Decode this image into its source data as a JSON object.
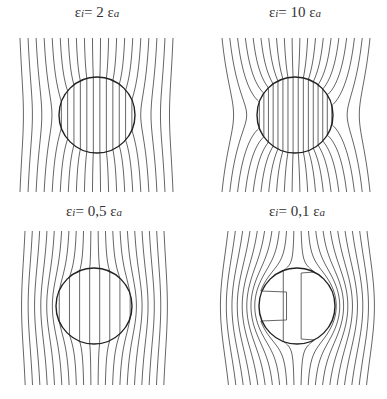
{
  "figure": {
    "panels": [
      {
        "id": "top-left",
        "title_prefix": "ε",
        "title_sub": "i",
        "title_mid": "= 2 ε",
        "title_sub2": "a",
        "ratio": 2,
        "title_pos": [
          97,
          14
        ],
        "circle": {
          "cx": 97,
          "cy": 115,
          "r": 38
        },
        "box": {
          "x0": 20,
          "x1": 173,
          "y0": 38,
          "y1": 192
        },
        "line_count": 20
      },
      {
        "id": "top-right",
        "title_prefix": "ε",
        "title_sub": "i",
        "title_mid": "= 10 ε",
        "title_sub2": "a",
        "ratio": 10,
        "title_pos": [
          295,
          14
        ],
        "circle": {
          "cx": 295,
          "cy": 115,
          "r": 38
        },
        "box": {
          "x0": 222,
          "x1": 370,
          "y0": 38,
          "y1": 192
        },
        "line_count": 20
      },
      {
        "id": "bottom-left",
        "title_prefix": "ε",
        "title_sub": "i",
        "title_mid": "= 0,5 ε",
        "title_sub2": "a",
        "ratio": 0.5,
        "title_pos": [
          94,
          206
        ],
        "circle": {
          "cx": 94,
          "cy": 306,
          "r": 38
        },
        "box": {
          "x0": 25,
          "x1": 164,
          "y0": 231,
          "y1": 385
        },
        "line_count": 20
      },
      {
        "id": "bottom-right",
        "title_prefix": "ε",
        "title_sub": "i",
        "title_mid": "= 0,1  ε",
        "title_sub2": "a",
        "ratio": 0.1,
        "title_pos": [
          297,
          206
        ],
        "circle": {
          "cx": 297,
          "cy": 306,
          "r": 38
        },
        "box": {
          "x0": 228,
          "x1": 367,
          "y0": 231,
          "y1": 385
        },
        "line_count": 20
      }
    ],
    "colors": {
      "field_line": "#555555",
      "circle": "#222222",
      "background": "#ffffff"
    }
  }
}
